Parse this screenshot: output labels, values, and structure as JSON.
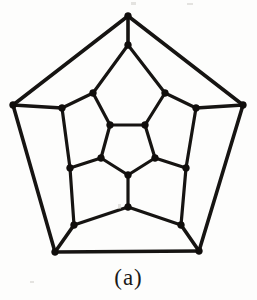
{
  "figure": {
    "caption": "(a)",
    "background_color": "#fdfdfc",
    "ink_color": "#161412",
    "vertex_color": "#100e0c",
    "vertex_radius": 3.4,
    "edge_width_outer": 3.6,
    "edge_width_inner": 3.2,
    "vertex_count": 20,
    "edge_count": 30,
    "vertices": [
      {
        "id": "o1",
        "name": "outer-apex",
        "x": 128,
        "y": 16,
        "ring": "outer"
      },
      {
        "id": "o2",
        "name": "outer-right",
        "x": 243,
        "y": 105,
        "ring": "outer"
      },
      {
        "id": "o3",
        "name": "outer-bottom-right",
        "x": 199,
        "y": 251,
        "ring": "outer"
      },
      {
        "id": "o4",
        "name": "outer-bottom-left",
        "x": 55,
        "y": 252,
        "ring": "outer"
      },
      {
        "id": "o5",
        "name": "outer-left",
        "x": 13,
        "y": 105,
        "ring": "outer"
      },
      {
        "id": "m1",
        "name": "mid-upper-left",
        "x": 93,
        "y": 93,
        "ring": "middle"
      },
      {
        "id": "m2",
        "name": "mid-upper-right",
        "x": 165,
        "y": 93,
        "ring": "middle"
      },
      {
        "id": "m3",
        "name": "mid-right-upper",
        "x": 196,
        "y": 108,
        "ring": "middle"
      },
      {
        "id": "m4",
        "name": "mid-right-lower",
        "x": 181,
        "y": 225,
        "ring": "middle"
      },
      {
        "id": "m5",
        "name": "mid-bottom",
        "x": 128,
        "y": 207,
        "ring": "middle"
      },
      {
        "id": "m6",
        "name": "mid-left-lower",
        "x": 74,
        "y": 225,
        "ring": "middle"
      },
      {
        "id": "m7",
        "name": "mid-left-upper",
        "x": 62,
        "y": 108,
        "ring": "middle"
      },
      {
        "id": "m8",
        "name": "mid-top",
        "x": 128,
        "y": 45,
        "ring": "middle"
      },
      {
        "id": "m9",
        "name": "mid-right-mid",
        "x": 186,
        "y": 168,
        "ring": "middle"
      },
      {
        "id": "m10",
        "name": "mid-left-mid",
        "x": 70,
        "y": 168,
        "ring": "middle"
      },
      {
        "id": "i1",
        "name": "inner-top-left",
        "x": 110,
        "y": 125,
        "ring": "inner"
      },
      {
        "id": "i2",
        "name": "inner-top-right",
        "x": 145,
        "y": 125,
        "ring": "inner"
      },
      {
        "id": "i3",
        "name": "inner-right",
        "x": 155,
        "y": 158,
        "ring": "inner"
      },
      {
        "id": "i4",
        "name": "inner-bottom",
        "x": 128,
        "y": 175,
        "ring": "inner"
      },
      {
        "id": "i5",
        "name": "inner-left",
        "x": 101,
        "y": 158,
        "ring": "inner"
      }
    ],
    "edges": [
      {
        "from": "o1",
        "to": "o2",
        "weight": "outer"
      },
      {
        "from": "o2",
        "to": "o3",
        "weight": "outer"
      },
      {
        "from": "o3",
        "to": "o4",
        "weight": "outer"
      },
      {
        "from": "o4",
        "to": "o5",
        "weight": "outer"
      },
      {
        "from": "o5",
        "to": "o1",
        "weight": "outer"
      },
      {
        "from": "o1",
        "to": "m8",
        "weight": "outer"
      },
      {
        "from": "o2",
        "to": "m3",
        "weight": "outer"
      },
      {
        "from": "o3",
        "to": "m4",
        "weight": "outer"
      },
      {
        "from": "o4",
        "to": "m6",
        "weight": "outer"
      },
      {
        "from": "o5",
        "to": "m7",
        "weight": "outer"
      },
      {
        "from": "m8",
        "to": "m1",
        "weight": "inner"
      },
      {
        "from": "m8",
        "to": "m2",
        "weight": "inner"
      },
      {
        "from": "m1",
        "to": "m7",
        "weight": "inner"
      },
      {
        "from": "m7",
        "to": "m10",
        "weight": "inner"
      },
      {
        "from": "m10",
        "to": "m6",
        "weight": "inner"
      },
      {
        "from": "m6",
        "to": "m5",
        "weight": "inner"
      },
      {
        "from": "m5",
        "to": "m4",
        "weight": "inner"
      },
      {
        "from": "m4",
        "to": "m9",
        "weight": "inner"
      },
      {
        "from": "m9",
        "to": "m3",
        "weight": "inner"
      },
      {
        "from": "m3",
        "to": "m2",
        "weight": "inner"
      },
      {
        "from": "m1",
        "to": "i1",
        "weight": "inner"
      },
      {
        "from": "m2",
        "to": "i2",
        "weight": "inner"
      },
      {
        "from": "m9",
        "to": "i3",
        "weight": "inner"
      },
      {
        "from": "m5",
        "to": "i4",
        "weight": "inner"
      },
      {
        "from": "m10",
        "to": "i5",
        "weight": "inner"
      },
      {
        "from": "i1",
        "to": "i2",
        "weight": "inner"
      },
      {
        "from": "i2",
        "to": "i3",
        "weight": "inner"
      },
      {
        "from": "i3",
        "to": "i4",
        "weight": "inner"
      },
      {
        "from": "i4",
        "to": "i5",
        "weight": "inner"
      },
      {
        "from": "i5",
        "to": "i1",
        "weight": "inner"
      }
    ],
    "specks": [
      {
        "name": "scan-speck-top-a",
        "x": 131,
        "y": 2,
        "w": 5,
        "h": 3
      },
      {
        "name": "scan-speck-top-b",
        "x": 187,
        "y": 3,
        "w": 6,
        "h": 2
      },
      {
        "name": "scan-speck-mid",
        "x": 118,
        "y": 204,
        "w": 3,
        "h": 5
      },
      {
        "name": "scan-speck-left",
        "x": 30,
        "y": 281,
        "w": 4,
        "h": 2
      }
    ]
  }
}
